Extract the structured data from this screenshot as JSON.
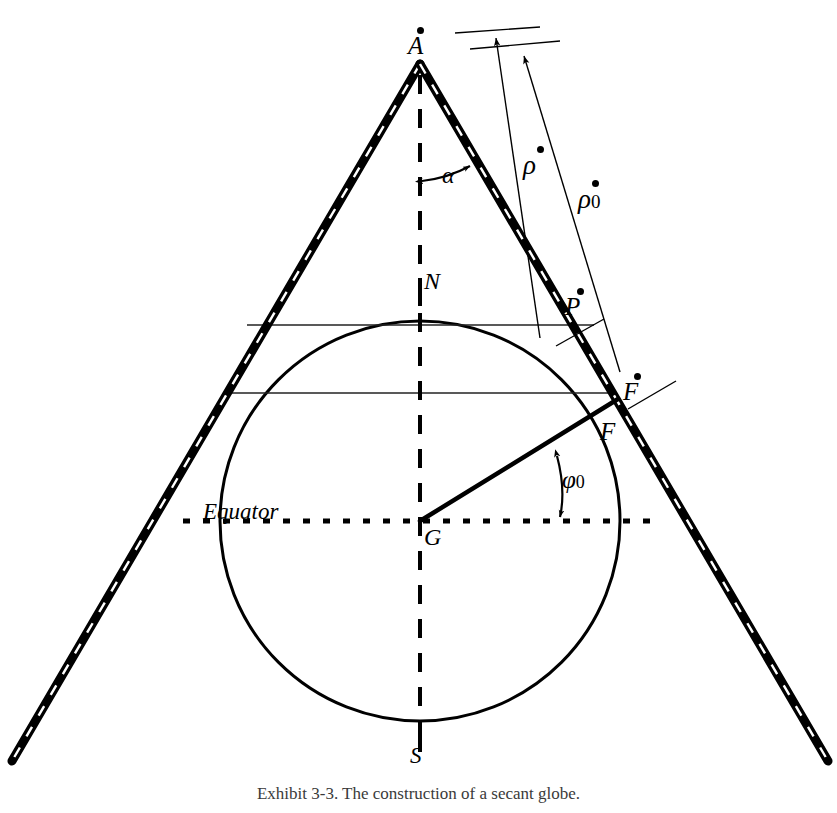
{
  "figure": {
    "caption": "Exhibit 3-3. The construction of a secant globe.",
    "labels": {
      "apex": "A",
      "rho": "ρ",
      "rho_zero": "ρ",
      "rho_zero_sub": "0",
      "alpha": "α",
      "north_pole": "N",
      "point_p": "P",
      "point_f_dot": "F",
      "point_f": "F",
      "phi": "φ",
      "phi_sub": "0",
      "equator": "Equator",
      "center": "G",
      "south_pole": "S"
    },
    "geometry": {
      "apex": [
        420,
        62
      ],
      "globe_center": [
        420,
        521
      ],
      "globe_radius": 200,
      "north_pole_point": [
        420,
        291
      ],
      "south_pole_point": [
        420,
        738
      ],
      "standard_parallel_upper": [
        613,
        393
      ],
      "standard_parallel_lower_y": 325,
      "cone_left_base": [
        12,
        760
      ],
      "cone_right_base": [
        828,
        760
      ],
      "phi_zero_degrees": 30,
      "alpha_degrees": 22
    },
    "colors": {
      "ink": "#000000",
      "paper": "#ffffff",
      "caption_ink": "#3a3a3a",
      "thin_line": "#1a1a1a"
    }
  }
}
